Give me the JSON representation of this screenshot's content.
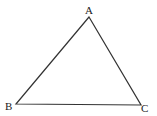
{
  "diagram": {
    "type": "triangle",
    "stroke_color": "#333333",
    "background": "#ffffff",
    "vertices": [
      {
        "label": "A",
        "x": 89,
        "y": 17,
        "label_x": 85,
        "label_y": 14
      },
      {
        "label": "B",
        "x": 16,
        "y": 104,
        "label_x": 5,
        "label_y": 110
      },
      {
        "label": "C",
        "x": 141,
        "y": 105,
        "label_x": 141,
        "label_y": 112
      }
    ],
    "edges": [
      {
        "from": "A",
        "to": "B"
      },
      {
        "from": "B",
        "to": "C"
      },
      {
        "from": "C",
        "to": "A"
      }
    ]
  }
}
